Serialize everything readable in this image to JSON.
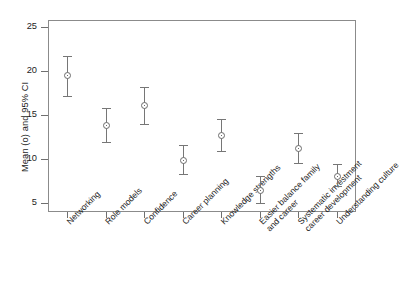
{
  "chart_data": {
    "type": "scatter",
    "title": "",
    "xlabel": "",
    "ylabel": "Mean (o) and 95% CI",
    "ylim": [
      3.0,
      26.0
    ],
    "yticks": [
      5,
      10,
      15,
      20,
      25
    ],
    "ytick_labels": [
      "5",
      "10",
      "15",
      "20",
      "25"
    ],
    "grid": false,
    "legend": "none",
    "marker": "open-circle",
    "error_bars": "95% CI with caps",
    "categories": [
      "Networking",
      "Role models",
      "Confidence",
      "Career planning",
      "Knowledge strengths",
      "Easier balance family and career",
      "Systematic investment career development",
      "Understanding culture"
    ],
    "category_lines": [
      [
        "Networking"
      ],
      [
        "Role models"
      ],
      [
        "Confidence"
      ],
      [
        "Career planning"
      ],
      [
        "Knowledge strengths"
      ],
      [
        "Easier balance family",
        "and career"
      ],
      [
        "Systematic investment",
        "career development"
      ],
      [
        "Understanding culture"
      ]
    ],
    "values": [
      19.5,
      13.9,
      16.1,
      9.9,
      12.7,
      6.5,
      11.2,
      8.1
    ],
    "ci_lower": [
      17.2,
      11.9,
      14.0,
      8.3,
      10.9,
      5.0,
      9.6,
      6.9
    ],
    "ci_upper": [
      21.7,
      15.8,
      18.2,
      11.6,
      14.6,
      8.1,
      13.0,
      9.4
    ],
    "series": [
      {
        "name": "Mean (o) and 95% CI",
        "points": [
          {
            "category": "Networking",
            "mean": 19.5,
            "ci_low": 17.2,
            "ci_high": 21.7
          },
          {
            "category": "Role models",
            "mean": 13.9,
            "ci_low": 11.9,
            "ci_high": 15.8
          },
          {
            "category": "Confidence",
            "mean": 16.1,
            "ci_low": 14.0,
            "ci_high": 18.2
          },
          {
            "category": "Career planning",
            "mean": 9.9,
            "ci_low": 8.3,
            "ci_high": 11.6
          },
          {
            "category": "Knowledge strengths",
            "mean": 12.7,
            "ci_low": 10.9,
            "ci_high": 14.6
          },
          {
            "category": "Easier balance family and career",
            "mean": 6.5,
            "ci_low": 5.0,
            "ci_high": 8.1
          },
          {
            "category": "Systematic investment career development",
            "mean": 11.2,
            "ci_low": 9.6,
            "ci_high": 13.0
          },
          {
            "category": "Understanding culture",
            "mean": 8.1,
            "ci_low": 6.9,
            "ci_high": 9.4
          }
        ]
      }
    ],
    "colors": {
      "marker": "#6b6b6b",
      "error_bar": "#767676",
      "axis": "#8b8b8b",
      "text": "#1d1d1d",
      "background": "#ffffff"
    }
  }
}
